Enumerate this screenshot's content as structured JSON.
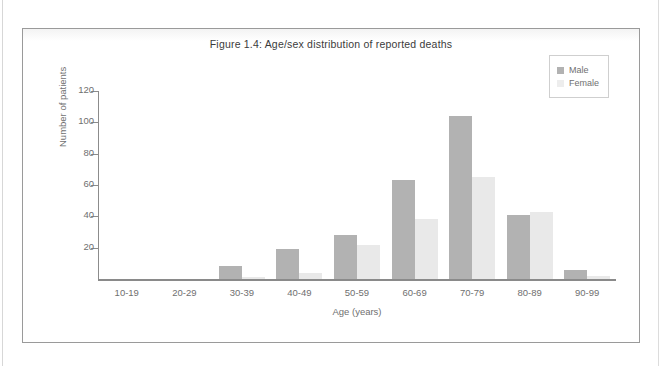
{
  "figure": {
    "title": "Figure 1.4: Age/sex distribution of reported deaths"
  },
  "legend": {
    "position": "top-right",
    "items": [
      {
        "label": "Male",
        "color": "#b2b2b2",
        "swatch": "male-swatch"
      },
      {
        "label": "Female",
        "color": "#e9e9e9",
        "swatch": "female-swatch"
      }
    ]
  },
  "chart_data": {
    "type": "bar",
    "title": "Figure 1.4: Age/sex distribution of reported deaths",
    "xlabel": "Age (years)",
    "ylabel": "Number of patients",
    "categories": [
      "10-19",
      "20-29",
      "30-39",
      "40-49",
      "50-59",
      "60-69",
      "70-79",
      "80-89",
      "90-99"
    ],
    "series": [
      {
        "name": "Male",
        "color": "#b2b2b2",
        "values": [
          0,
          0,
          8,
          19,
          28,
          63,
          104,
          41,
          6
        ]
      },
      {
        "name": "Female",
        "color": "#e9e9e9",
        "values": [
          0,
          0,
          1,
          4,
          22,
          38,
          65,
          43,
          2
        ]
      }
    ],
    "ylim": [
      0,
      120
    ],
    "yticks": [
      20,
      40,
      60,
      80,
      100,
      120
    ],
    "ytick_labels": [
      "20",
      "40",
      "60",
      "80",
      "100",
      "120"
    ],
    "grid": false,
    "legend_position": "top-right"
  }
}
